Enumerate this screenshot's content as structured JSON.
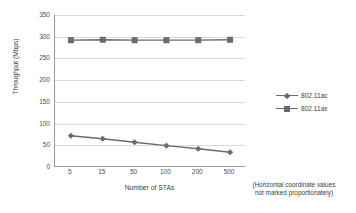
{
  "chart_data": {
    "type": "line",
    "title": "",
    "xlabel": "Number of STAs",
    "ylabel": "Throughput (Mbps)",
    "categories": [
      "5",
      "15",
      "50",
      "100",
      "200",
      "500"
    ],
    "ylim": [
      0,
      350
    ],
    "ytick_step": 50,
    "yticks": [
      "0",
      "50",
      "100",
      "150",
      "200",
      "250",
      "300",
      "350"
    ],
    "grid": true,
    "legend_position": "right",
    "annotation": "(Horizontal coordinate values not marked proportionately)",
    "annotation_line1": "(Horizontal coordinate values",
    "annotation_line2": "not marked proportionately)",
    "series": [
      {
        "name": "802.11ac",
        "marker": "diamond",
        "color": "#6b6b6b",
        "values": [
          72,
          65,
          57,
          49,
          42,
          34
        ]
      },
      {
        "name": "802.11ax",
        "marker": "square",
        "color": "#6b6b6b",
        "values": [
          292,
          293,
          292,
          292,
          292,
          293
        ]
      }
    ]
  },
  "legend": {
    "items": [
      {
        "label": "802.11ac",
        "marker": "diamond"
      },
      {
        "label": "802.11ax",
        "marker": "square"
      }
    ]
  },
  "colors": {
    "series": "#6b6b6b",
    "grid": "#d9d9d9",
    "axis": "#9a9a9a",
    "text": "#3d3d3d",
    "background": "#ffffff"
  }
}
